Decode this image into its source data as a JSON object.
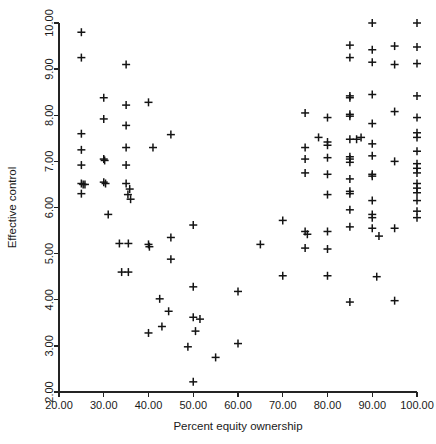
{
  "chart_data": {
    "type": "scatter",
    "title": "",
    "xlabel": "Percent equity ownership",
    "ylabel": "Effective control",
    "xlim": [
      20.0,
      100.0
    ],
    "ylim": [
      2.0,
      10.0
    ],
    "xticks": [
      20.0,
      30.0,
      40.0,
      50.0,
      60.0,
      70.0,
      80.0,
      90.0,
      100.0
    ],
    "yticks": [
      2.0,
      3.0,
      4.0,
      5.0,
      6.0,
      7.0,
      8.0,
      9.0,
      10.0
    ],
    "xtick_labels": [
      "20.00",
      "30.00",
      "40.00",
      "50.00",
      "60.00",
      "70.00",
      "80.00",
      "90.00",
      "100.00"
    ],
    "ytick_labels": [
      "2.00",
      "3.00",
      "4.00",
      "5.00",
      "6.00",
      "7.00",
      "8.00",
      "9.00",
      "10.00"
    ],
    "grid": false,
    "legend": null,
    "marker": "plus",
    "marker_color": "#141414",
    "series": [
      {
        "name": "firms",
        "points": [
          [
            25.0,
            9.8
          ],
          [
            25.0,
            9.25
          ],
          [
            25.0,
            7.6
          ],
          [
            25.0,
            7.25
          ],
          [
            25.0,
            6.92
          ],
          [
            25.0,
            6.52
          ],
          [
            25.4,
            6.5
          ],
          [
            25.8,
            6.5
          ],
          [
            25.0,
            6.3
          ],
          [
            30.0,
            8.38
          ],
          [
            30.0,
            7.92
          ],
          [
            30.0,
            7.05
          ],
          [
            30.2,
            7.02
          ],
          [
            30.0,
            6.55
          ],
          [
            30.4,
            6.52
          ],
          [
            31.0,
            5.85
          ],
          [
            35.0,
            9.1
          ],
          [
            35.0,
            8.22
          ],
          [
            35.0,
            7.78
          ],
          [
            35.0,
            7.3
          ],
          [
            35.0,
            6.92
          ],
          [
            35.0,
            6.52
          ],
          [
            35.8,
            6.4
          ],
          [
            35.4,
            6.28
          ],
          [
            36.0,
            6.18
          ],
          [
            33.5,
            5.22
          ],
          [
            35.5,
            5.22
          ],
          [
            34.0,
            4.6
          ],
          [
            35.5,
            4.6
          ],
          [
            40.0,
            8.28
          ],
          [
            41.0,
            7.3
          ],
          [
            40.0,
            5.2
          ],
          [
            40.2,
            5.15
          ],
          [
            40.0,
            3.28
          ],
          [
            45.0,
            7.58
          ],
          [
            45.0,
            5.35
          ],
          [
            45.0,
            4.88
          ],
          [
            42.5,
            4.02
          ],
          [
            44.5,
            3.75
          ],
          [
            43.0,
            3.42
          ],
          [
            50.0,
            5.62
          ],
          [
            50.0,
            4.28
          ],
          [
            50.0,
            3.62
          ],
          [
            51.5,
            3.58
          ],
          [
            50.5,
            3.32
          ],
          [
            48.8,
            2.98
          ],
          [
            50.0,
            2.22
          ],
          [
            55.0,
            2.75
          ],
          [
            60.0,
            4.18
          ],
          [
            60.0,
            3.05
          ],
          [
            65.0,
            5.2
          ],
          [
            70.0,
            5.72
          ],
          [
            70.0,
            4.52
          ],
          [
            75.0,
            8.05
          ],
          [
            75.0,
            7.3
          ],
          [
            75.0,
            7.05
          ],
          [
            75.0,
            6.75
          ],
          [
            75.0,
            5.48
          ],
          [
            75.5,
            5.42
          ],
          [
            75.0,
            5.12
          ],
          [
            78.0,
            7.52
          ],
          [
            80.0,
            7.95
          ],
          [
            80.0,
            7.42
          ],
          [
            80.0,
            7.35
          ],
          [
            80.0,
            7.08
          ],
          [
            80.0,
            6.72
          ],
          [
            80.0,
            6.28
          ],
          [
            80.0,
            5.48
          ],
          [
            80.0,
            5.1
          ],
          [
            80.0,
            4.52
          ],
          [
            85.0,
            9.52
          ],
          [
            85.0,
            9.25
          ],
          [
            85.0,
            8.42
          ],
          [
            85.0,
            8.38
          ],
          [
            85.0,
            8.02
          ],
          [
            85.0,
            7.98
          ],
          [
            85.0,
            7.48
          ],
          [
            85.0,
            7.1
          ],
          [
            85.0,
            7.05
          ],
          [
            85.0,
            6.98
          ],
          [
            85.0,
            6.62
          ],
          [
            85.0,
            6.35
          ],
          [
            85.0,
            6.3
          ],
          [
            85.0,
            5.95
          ],
          [
            85.0,
            5.58
          ],
          [
            85.0,
            3.95
          ],
          [
            86.5,
            7.48
          ],
          [
            87.5,
            7.52
          ],
          [
            90.0,
            10.0
          ],
          [
            90.0,
            9.42
          ],
          [
            90.0,
            9.15
          ],
          [
            90.0,
            8.45
          ],
          [
            90.0,
            7.82
          ],
          [
            90.0,
            7.38
          ],
          [
            90.0,
            7.12
          ],
          [
            90.0,
            6.72
          ],
          [
            90.0,
            6.68
          ],
          [
            90.0,
            6.15
          ],
          [
            90.0,
            5.85
          ],
          [
            90.0,
            5.78
          ],
          [
            90.0,
            5.55
          ],
          [
            91.5,
            5.38
          ],
          [
            91.0,
            4.5
          ],
          [
            95.0,
            9.5
          ],
          [
            95.0,
            9.1
          ],
          [
            95.0,
            8.08
          ],
          [
            95.0,
            7.0
          ],
          [
            95.0,
            5.55
          ],
          [
            95.0,
            3.98
          ],
          [
            100.0,
            10.0
          ],
          [
            100.0,
            9.48
          ],
          [
            100.0,
            9.12
          ],
          [
            100.0,
            8.42
          ],
          [
            100.0,
            7.95
          ],
          [
            100.0,
            7.62
          ],
          [
            100.0,
            7.52
          ],
          [
            100.0,
            7.22
          ],
          [
            100.0,
            6.95
          ],
          [
            100.0,
            6.85
          ],
          [
            100.0,
            6.75
          ],
          [
            100.0,
            6.52
          ],
          [
            100.0,
            6.42
          ],
          [
            100.0,
            6.32
          ],
          [
            100.0,
            6.15
          ],
          [
            100.0,
            5.92
          ],
          [
            100.0,
            5.78
          ]
        ]
      }
    ]
  },
  "axes": {
    "x_title": "Percent equity ownership",
    "y_title": "Effective control"
  }
}
